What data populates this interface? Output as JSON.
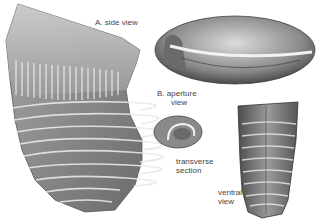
{
  "figure": {
    "labels": {
      "a_side": "A.  side view",
      "b_aperture_1": "B.  aperture",
      "b_aperture_2": "view",
      "transverse_1": "transverse",
      "transverse_2": "section",
      "ventral_1": "ventral",
      "ventral_2": "view"
    },
    "colors": {
      "background": "#ffffff",
      "specimen_dark": "#5a5a5a",
      "specimen_mid": "#8c8c8c",
      "specimen_light": "#c8c8c8",
      "label_text": "#444444"
    }
  }
}
